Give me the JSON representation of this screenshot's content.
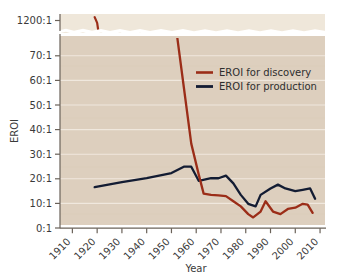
{
  "chart_data": {
    "type": "line",
    "title": "",
    "xlabel": "Year",
    "ylabel": "EROI",
    "xlim": [
      1905,
      2012
    ],
    "ylim": [
      0,
      75
    ],
    "grid": true,
    "legend_position": "upper-right",
    "y_axis_break": {
      "present": true,
      "lower_panel_range": [
        0,
        75
      ],
      "upper_panel_range": [
        1100,
        1250
      ],
      "upper_panel_tick": "1200:1",
      "style": "torn-paper"
    },
    "x_ticks": [
      1910,
      1920,
      1930,
      1940,
      1950,
      1960,
      1970,
      1980,
      1990,
      2000,
      2010
    ],
    "x_tick_labels": [
      "1910",
      "1920",
      "1930",
      "1940",
      "1950",
      "1960",
      "1970",
      "1980",
      "1990",
      "2000",
      "2010"
    ],
    "y_ticks": [
      0,
      10,
      20,
      30,
      40,
      50,
      60,
      70,
      1200
    ],
    "y_tick_labels": [
      "0:1",
      "10:1",
      "20:1",
      "30:1",
      "40:1",
      "50:1",
      "60:1",
      "70:1",
      "1200:1"
    ],
    "series": [
      {
        "name": "EROI for discovery",
        "color": "#9b2d18",
        "x": [
          1919,
          1920,
          1952,
          1955,
          1958,
          1961,
          1963,
          1966,
          1969,
          1972,
          1975,
          1978,
          1981,
          1983,
          1986,
          1988,
          1991,
          1994,
          1997,
          2000,
          2003,
          2005,
          2007
        ],
        "y": [
          1225,
          1180,
          77,
          55,
          33,
          21,
          13.5,
          13,
          12.8,
          12.5,
          10.5,
          8.5,
          5.5,
          4.2,
          6.5,
          10.5,
          6.5,
          5.5,
          7.5,
          8,
          9.5,
          9.2,
          6
        ]
      },
      {
        "name": "EROI for production",
        "color": "#131c33",
        "x": [
          1919,
          1930,
          1940,
          1950,
          1955,
          1958,
          1961,
          1966,
          1969,
          1972,
          1975,
          1978,
          1981,
          1984,
          1986,
          1990,
          1993,
          1996,
          2000,
          2003,
          2006,
          2008
        ],
        "y": [
          16,
          18,
          19.5,
          21.5,
          24,
          24,
          18.5,
          19.5,
          19.5,
          20.5,
          17.5,
          13,
          9.5,
          8.5,
          13,
          15.5,
          17,
          15.5,
          14.5,
          15,
          15.5,
          11.5
        ]
      }
    ]
  },
  "legend": {
    "items": [
      {
        "label": "EROI for discovery",
        "color": "#9b2d18"
      },
      {
        "label": "EROI for production",
        "color": "#131c33"
      }
    ]
  },
  "axes": {
    "y_title": "EROI",
    "x_title": "Year",
    "y_labels": [
      "1200:1",
      "70:1",
      "60:1",
      "50:1",
      "40:1",
      "30:1",
      "20:1",
      "10:1",
      "0:1"
    ],
    "x_labels": [
      "1910",
      "1920",
      "1930",
      "1940",
      "1950",
      "1960",
      "1970",
      "1980",
      "1990",
      "2000",
      "2010"
    ]
  },
  "colors": {
    "page_background": "#ffffff",
    "plot_background": "#ddcfbe",
    "upper_panel_background": "#efe7da",
    "gridline": "#f3ece3",
    "axis": "#6a6259",
    "discovery": "#9b2d18",
    "production": "#131c33",
    "text": "#3a3a3a"
  }
}
